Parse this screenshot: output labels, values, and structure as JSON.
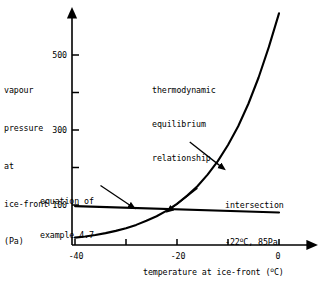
{
  "chart_data": {
    "type": "line",
    "title": "",
    "xlabel": "temperature at ice-front (°C)",
    "ylabel": "vapour pressure at ice-front (Pa)",
    "xlim": [
      -42,
      2
    ],
    "ylim": [
      0,
      640
    ],
    "grid": false,
    "legend": "none",
    "xticks": [
      -40,
      -30,
      -20,
      -10,
      0
    ],
    "xtick_labels": [
      "-40",
      "",
      "-20",
      "",
      "0"
    ],
    "yticks": [
      100,
      200,
      300,
      400,
      500
    ],
    "ytick_labels": [
      "100",
      "",
      "300",
      "",
      "500"
    ],
    "series": [
      {
        "name": "thermodynamic equilibrium relationship",
        "x": [
          -40,
          -38,
          -36,
          -34,
          -32,
          -30,
          -28,
          -26,
          -24,
          -22,
          -20,
          -18,
          -16,
          -14,
          -12,
          -10,
          -8,
          -6,
          -4,
          -2,
          0
        ],
        "y": [
          13,
          16,
          20,
          25,
          31,
          38,
          47,
          58,
          70,
          85,
          103,
          125,
          150,
          181,
          217,
          260,
          310,
          370,
          440,
          521,
          611
        ]
      },
      {
        "name": "equation of example 4.7",
        "x": [
          -40,
          0
        ],
        "y": [
          97,
          80
        ]
      }
    ],
    "annotations": [
      {
        "name": "thermodynamic-equilibrium-label",
        "lines": [
          "thermodynamic",
          "equilibrium",
          "relationship"
        ],
        "arrow_from": [
          -17.5,
          268
        ],
        "arrow_to": [
          -11.6,
          205
        ]
      },
      {
        "name": "equation-label",
        "lines": [
          "equation of",
          "example 4.7"
        ],
        "arrow_from": [
          -35.0,
          152
        ],
        "arrow_to": [
          -29.3,
          100
        ]
      },
      {
        "name": "intersection-label",
        "lines": [
          "intersection",
          "-22°C, 85Pa"
        ],
        "point_x": -22,
        "point_y": 85,
        "point_label_temperature": "-22",
        "point_label_temperature_unit": "°C",
        "point_label_pressure": "85Pa",
        "arrow_from": [
          -16.0,
          145
        ],
        "arrow_to": [
          -21.0,
          92
        ]
      }
    ]
  },
  "axes": {
    "y_label_lines": [
      "vapour",
      "pressure",
      "at",
      "ice-front",
      "(Pa)"
    ],
    "x_label_text": "temperature at ice-front ",
    "x_label_unit_open": "(",
    "x_label_unit_sup": "o",
    "x_label_unit_rest": "C)",
    "ytick_500": "500",
    "ytick_300": "300",
    "ytick_100": "100",
    "xtick_minus40": "-40",
    "xtick_minus20": "-20",
    "xtick_zero": "0"
  },
  "annotations": {
    "thermo": {
      "line1": "thermodynamic",
      "line2": "equilibrium",
      "line3": "relationship"
    },
    "equation": {
      "line1": "equation of",
      "line2": "example 4.7"
    },
    "intersection": {
      "line1": "intersection",
      "value_prefix": "-22",
      "value_sup": "o",
      "value_rest": "C, 85Pa"
    }
  },
  "colors": {
    "ink": "#000000",
    "background": "#ffffff"
  }
}
